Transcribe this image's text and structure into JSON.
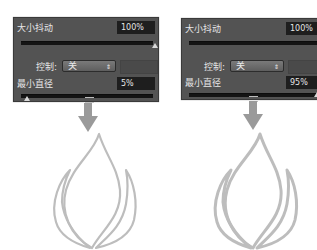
{
  "panels": [
    {
      "id": "left",
      "size_jitter": {
        "label": "大小抖动",
        "value": "100%"
      },
      "control": {
        "label": "控制:",
        "selected": "关"
      },
      "min_diameter": {
        "label": "最小直径",
        "value": "5%"
      }
    },
    {
      "id": "right",
      "size_jitter": {
        "label": "大小抖动",
        "value": "100%"
      },
      "control": {
        "label": "控制:",
        "selected": "关"
      },
      "min_diameter": {
        "label": "最小直径",
        "value": "95%"
      }
    }
  ],
  "icons": {
    "arrow": "down-arrow-icon",
    "result": "flame-outline-icon",
    "select_arrow": "⇕"
  },
  "colors": {
    "panel_bg": "#535353",
    "field_bg": "#1e1e1e",
    "arrow": "#9a9a9a",
    "flame_stroke": "#bdbdbd"
  }
}
